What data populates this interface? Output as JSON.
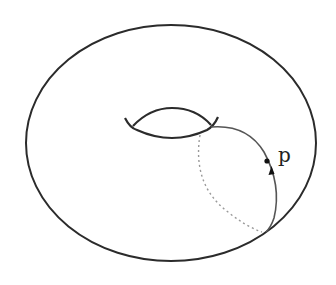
{
  "figure": {
    "point_label": "p",
    "colors": {
      "background": "#ffffff",
      "outline": "#2b2b2b",
      "meridian": "#555555",
      "hidden_dashed": "#999999",
      "point": "#111111"
    }
  }
}
